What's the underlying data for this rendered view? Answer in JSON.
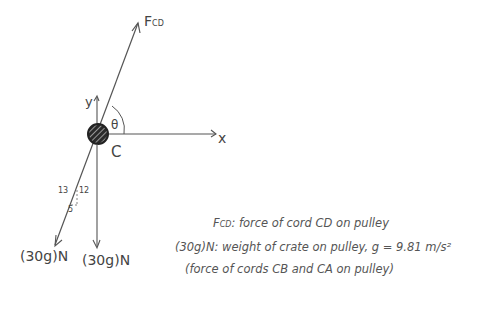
{
  "diagram": {
    "colors": {
      "line": "#555555",
      "ink": "#444444",
      "pulley_fill": "#2a2a2a"
    },
    "force_label": {
      "main": "F",
      "sub": "CD"
    },
    "axes": {
      "x": "x",
      "y": "y"
    },
    "point_label": "C",
    "angle_label": "θ",
    "slope_triangle": {
      "hyp": "13",
      "vertical": "12",
      "horizontal": "5"
    },
    "weights": [
      {
        "label": "(30g)N",
        "direction": "along 5-12-13 slope"
      },
      {
        "label": "(30g)N",
        "direction": "vertical down"
      }
    ],
    "legend": [
      {
        "symbol": "F",
        "symbol_sub": "CD",
        "text": ": force of cord CD on pulley"
      },
      {
        "symbol": "(30g)N",
        "text": ": weight of crate on pulley, g = 9.81 m/s²"
      },
      {
        "symbol": "",
        "text": "(force of cords CB and CA on pulley)"
      }
    ]
  }
}
